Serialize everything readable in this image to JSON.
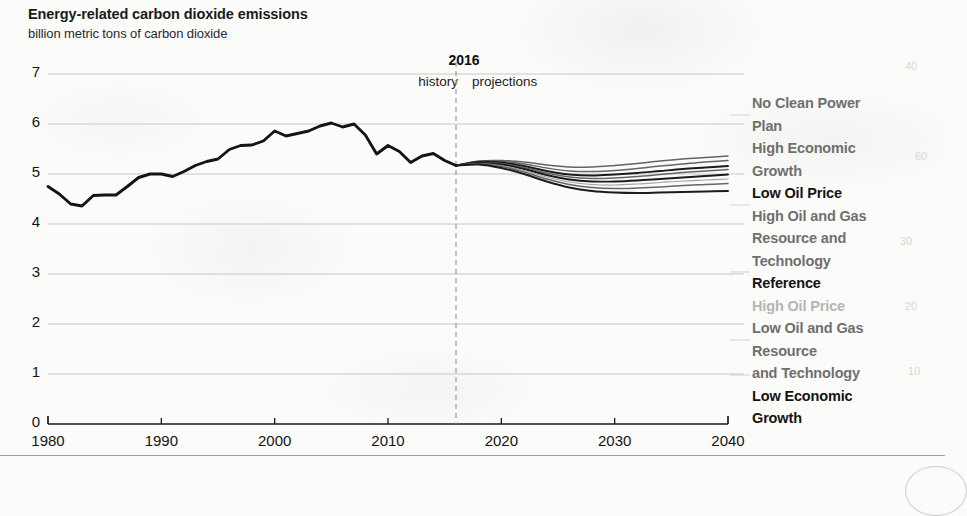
{
  "title": "Energy-related carbon dioxide emissions",
  "subtitle": "billion metric tons of carbon dioxide",
  "divider": {
    "year_label": "2016",
    "left_label": "history",
    "right_label": "projections"
  },
  "legend": {
    "items": [
      {
        "label": "No Clean Power\nPlan",
        "emphasis": "medium"
      },
      {
        "label": "High Economic\nGrowth",
        "emphasis": "medium"
      },
      {
        "label": "Low Oil Price",
        "emphasis": "strong"
      },
      {
        "label": "High Oil and Gas\nResource and\nTechnology",
        "emphasis": "medium"
      },
      {
        "label": "Reference",
        "emphasis": "strong"
      },
      {
        "label": "High Oil Price",
        "emphasis": "faint"
      },
      {
        "label": "Low Oil and Gas\nResource\nand Technology",
        "emphasis": "medium"
      },
      {
        "label": "Low Economic\nGrowth",
        "emphasis": "strong"
      }
    ]
  },
  "colors": {
    "history_line": "#141414",
    "axis": "#1a1a1a",
    "gridline": "#b9b9b9",
    "divider": "#9a9a9a",
    "legend_strong": "#141414",
    "legend_medium": "#6f6f6f",
    "legend_faint": "#b5b5b5",
    "paper": "#fbfbfa"
  },
  "chart_data": {
    "type": "line",
    "title": "Energy-related carbon dioxide emissions",
    "subtitle": "billion metric tons of carbon dioxide",
    "xlabel": "",
    "ylabel": "billion metric tons of carbon dioxide",
    "xlim": [
      1980,
      2040
    ],
    "ylim": [
      0,
      7
    ],
    "xticks": [
      1980,
      1990,
      2000,
      2010,
      2020,
      2030,
      2040
    ],
    "yticks": [
      0,
      1,
      2,
      3,
      4,
      5,
      6,
      7
    ],
    "grid": true,
    "legend_position": "right",
    "projection_start": 2016,
    "annotations": [
      {
        "text": "2016",
        "x": 2016,
        "type": "divider-year"
      },
      {
        "text": "history",
        "x": 2010,
        "type": "region-label"
      },
      {
        "text": "projections",
        "x": 2023,
        "type": "region-label"
      }
    ],
    "history": {
      "name": "History",
      "x": [
        1980,
        1981,
        1982,
        1983,
        1984,
        1985,
        1986,
        1987,
        1988,
        1989,
        1990,
        1991,
        1992,
        1993,
        1994,
        1995,
        1996,
        1997,
        1998,
        1999,
        2000,
        2001,
        2002,
        2003,
        2004,
        2005,
        2006,
        2007,
        2008,
        2009,
        2010,
        2011,
        2012,
        2013,
        2014,
        2015,
        2016
      ],
      "values": [
        4.75,
        4.6,
        4.4,
        4.36,
        4.57,
        4.58,
        4.58,
        4.75,
        4.93,
        5.0,
        5.0,
        4.95,
        5.05,
        5.17,
        5.25,
        5.3,
        5.49,
        5.57,
        5.58,
        5.66,
        5.86,
        5.76,
        5.81,
        5.86,
        5.96,
        6.02,
        5.94,
        6.0,
        5.78,
        5.4,
        5.57,
        5.45,
        5.23,
        5.36,
        5.41,
        5.27,
        5.17
      ]
    },
    "series": [
      {
        "name": "No Clean Power Plan",
        "x": [
          2016,
          2018,
          2020,
          2022,
          2024,
          2026,
          2028,
          2030,
          2032,
          2034,
          2036,
          2038,
          2040
        ],
        "values": [
          5.17,
          5.26,
          5.27,
          5.24,
          5.18,
          5.14,
          5.14,
          5.17,
          5.21,
          5.26,
          5.3,
          5.33,
          5.36
        ]
      },
      {
        "name": "High Economic Growth",
        "x": [
          2016,
          2018,
          2020,
          2022,
          2024,
          2026,
          2028,
          2030,
          2032,
          2034,
          2036,
          2038,
          2040
        ],
        "values": [
          5.17,
          5.25,
          5.25,
          5.2,
          5.12,
          5.06,
          5.05,
          5.07,
          5.11,
          5.16,
          5.2,
          5.24,
          5.27
        ]
      },
      {
        "name": "Low Oil Price",
        "x": [
          2016,
          2018,
          2020,
          2022,
          2024,
          2026,
          2028,
          2030,
          2032,
          2034,
          2036,
          2038,
          2040
        ],
        "values": [
          5.17,
          5.24,
          5.23,
          5.16,
          5.06,
          4.99,
          4.97,
          4.99,
          5.02,
          5.06,
          5.1,
          5.13,
          5.16
        ]
      },
      {
        "name": "High Oil and Gas Resource and Technology",
        "x": [
          2016,
          2018,
          2020,
          2022,
          2024,
          2026,
          2028,
          2030,
          2032,
          2034,
          2036,
          2038,
          2040
        ],
        "values": [
          5.17,
          5.23,
          5.21,
          5.13,
          5.02,
          4.94,
          4.91,
          4.92,
          4.95,
          4.99,
          5.03,
          5.06,
          5.09
        ]
      },
      {
        "name": "Reference",
        "x": [
          2016,
          2018,
          2020,
          2022,
          2024,
          2026,
          2028,
          2030,
          2032,
          2034,
          2036,
          2038,
          2040
        ],
        "values": [
          5.17,
          5.22,
          5.19,
          5.1,
          4.98,
          4.89,
          4.85,
          4.85,
          4.87,
          4.9,
          4.93,
          4.96,
          4.99
        ]
      },
      {
        "name": "High Oil Price",
        "x": [
          2016,
          2018,
          2020,
          2022,
          2024,
          2026,
          2028,
          2030,
          2032,
          2034,
          2036,
          2038,
          2040
        ],
        "values": [
          5.17,
          5.21,
          5.17,
          5.07,
          4.94,
          4.84,
          4.79,
          4.78,
          4.8,
          4.83,
          4.86,
          4.88,
          4.9
        ]
      },
      {
        "name": "Low Oil and Gas Resource and Technology",
        "x": [
          2016,
          2018,
          2020,
          2022,
          2024,
          2026,
          2028,
          2030,
          2032,
          2034,
          2036,
          2038,
          2040
        ],
        "values": [
          5.17,
          5.2,
          5.15,
          5.04,
          4.9,
          4.79,
          4.73,
          4.71,
          4.72,
          4.74,
          4.77,
          4.79,
          4.81
        ]
      },
      {
        "name": "Low Economic Growth",
        "x": [
          2016,
          2018,
          2020,
          2022,
          2024,
          2026,
          2028,
          2030,
          2032,
          2034,
          2036,
          2038,
          2040
        ],
        "values": [
          5.17,
          5.19,
          5.12,
          5.0,
          4.85,
          4.73,
          4.66,
          4.63,
          4.62,
          4.63,
          4.64,
          4.65,
          4.66
        ]
      }
    ]
  },
  "ghost_marks": [
    {
      "text": "40",
      "x": 905,
      "y": 60
    },
    {
      "text": "60",
      "x": 915,
      "y": 150
    },
    {
      "text": "30",
      "x": 900,
      "y": 235
    },
    {
      "text": "20",
      "x": 905,
      "y": 300
    },
    {
      "text": "10",
      "x": 908,
      "y": 365
    }
  ]
}
